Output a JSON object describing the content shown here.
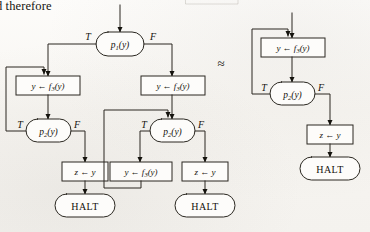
{
  "page": {
    "running_text": "d therefore",
    "equivalence_symbol": "≈",
    "width": 370,
    "height": 232,
    "ink_color": "#14120d",
    "paper_color": "#fbfaf7"
  },
  "labels": {
    "true": "T",
    "false": "F",
    "halt": "HALT",
    "assign_y": "y ← f",
    "assign_y_sub": "3",
    "assign_y_tail": "(y)",
    "assign_z": "z ← y",
    "pred_p1": "p",
    "pred_p1_sub": "1",
    "pred_p2": "p",
    "pred_p2_sub": "2",
    "pred_tail": "(y)"
  },
  "flowchart_left": {
    "name": "left-flowchart",
    "nodes": [
      {
        "id": "entry",
        "type": "entry-arrow",
        "x": 120,
        "y": 10,
        "label": ""
      },
      {
        "id": "p1",
        "type": "predicate",
        "x": 120,
        "y": 44,
        "label": "p1(y)"
      },
      {
        "id": "asgn-t",
        "type": "assignment",
        "x": 48,
        "y": 86,
        "label": "y ← f3(y)"
      },
      {
        "id": "p2-t",
        "type": "predicate",
        "x": 48,
        "y": 131,
        "label": "p2(y)"
      },
      {
        "id": "asgn-z-t",
        "type": "assignment",
        "x": 85,
        "y": 172,
        "label": "z ← y"
      },
      {
        "id": "halt-t",
        "type": "halt",
        "x": 85,
        "y": 205,
        "label": "HALT"
      },
      {
        "id": "asgn-f",
        "type": "assignment",
        "x": 172,
        "y": 86,
        "label": "y ← f3(y)"
      },
      {
        "id": "p2-f",
        "type": "predicate",
        "x": 172,
        "y": 131,
        "label": "p2(y)"
      },
      {
        "id": "asgn-loop-f",
        "type": "assignment",
        "x": 140,
        "y": 172,
        "label": "y ← f3(y)"
      },
      {
        "id": "asgn-z-f",
        "type": "assignment",
        "x": 205,
        "y": 172,
        "label": "z ← y"
      },
      {
        "id": "halt-f",
        "type": "halt",
        "x": 205,
        "y": 205,
        "label": "HALT"
      }
    ],
    "edges": [
      {
        "from": "entry",
        "to": "p1",
        "label": ""
      },
      {
        "from": "p1",
        "to": "asgn-t",
        "label": "T"
      },
      {
        "from": "p1",
        "to": "asgn-f",
        "label": "F"
      },
      {
        "from": "asgn-t",
        "to": "p2-t",
        "label": ""
      },
      {
        "from": "p2-t",
        "to": "asgn-t",
        "label": "T"
      },
      {
        "from": "p2-t",
        "to": "asgn-z-t",
        "label": "F"
      },
      {
        "from": "asgn-z-t",
        "to": "halt-t",
        "label": ""
      },
      {
        "from": "asgn-f",
        "to": "p2-f",
        "label": ""
      },
      {
        "from": "p2-f",
        "to": "asgn-loop-f",
        "label": "T"
      },
      {
        "from": "p2-f",
        "to": "asgn-z-f",
        "label": "F"
      },
      {
        "from": "asgn-loop-f",
        "to": "p2-f",
        "label": ""
      },
      {
        "from": "asgn-z-f",
        "to": "halt-f",
        "label": ""
      }
    ]
  },
  "flowchart_right": {
    "name": "right-flowchart",
    "nodes": [
      {
        "id": "entry-r",
        "type": "entry-arrow",
        "x": 292,
        "y": 18,
        "label": ""
      },
      {
        "id": "asgn-r",
        "type": "assignment",
        "x": 292,
        "y": 48,
        "label": "y ← f3(y)"
      },
      {
        "id": "p2-r",
        "type": "predicate",
        "x": 292,
        "y": 94,
        "label": "p2(y)"
      },
      {
        "id": "asgn-z-r",
        "type": "assignment",
        "x": 330,
        "y": 135,
        "label": "z ← y"
      },
      {
        "id": "halt-r",
        "type": "halt",
        "x": 330,
        "y": 168,
        "label": "HALT"
      }
    ],
    "edges": [
      {
        "from": "entry-r",
        "to": "asgn-r",
        "label": ""
      },
      {
        "from": "asgn-r",
        "to": "p2-r",
        "label": ""
      },
      {
        "from": "p2-r",
        "to": "asgn-r",
        "label": "T"
      },
      {
        "from": "p2-r",
        "to": "asgn-z-r",
        "label": "F"
      },
      {
        "from": "asgn-z-r",
        "to": "halt-r",
        "label": ""
      }
    ]
  }
}
